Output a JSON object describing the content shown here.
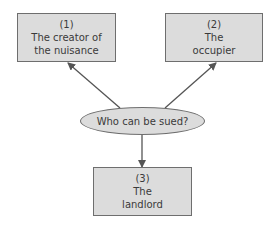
{
  "diagram": {
    "center": {
      "label": "Who can be sued?"
    },
    "nodes": [
      {
        "number": "(1)",
        "line1": "The creator of",
        "line2": "the nuisance"
      },
      {
        "number": "(2)",
        "line1": "The",
        "line2": "occupier"
      },
      {
        "number": "(3)",
        "line1": "The",
        "line2": "landlord"
      }
    ],
    "edges": [
      {
        "from": "Who can be sued?",
        "to": "(1) The creator of the nuisance"
      },
      {
        "from": "Who can be sued?",
        "to": "(2) The occupier"
      },
      {
        "from": "Who can be sued?",
        "to": "(3) The landlord"
      }
    ],
    "colors": {
      "fill": "#dcdcdc",
      "stroke": "#6e6e6e",
      "text": "#3a3a3a"
    }
  }
}
